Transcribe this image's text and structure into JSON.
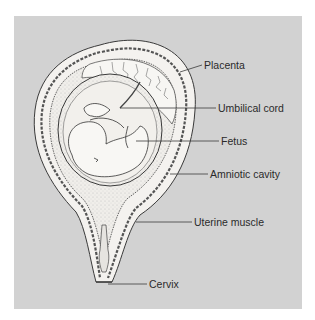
{
  "figure": {
    "background_color": "#d2d2d2",
    "organ_fill": "#f4f2ef",
    "line_color": "#3a3a3a",
    "labels": [
      {
        "text": "Placenta",
        "x": 204,
        "y": 59
      },
      {
        "text": "Umbilical cord",
        "x": 218,
        "y": 102
      },
      {
        "text": "Fetus",
        "x": 221,
        "y": 135
      },
      {
        "text": "Amniotic cavity",
        "x": 210,
        "y": 168
      },
      {
        "text": "Uterine muscle",
        "x": 194,
        "y": 216
      },
      {
        "text": "Cervix",
        "x": 149,
        "y": 278
      }
    ]
  }
}
